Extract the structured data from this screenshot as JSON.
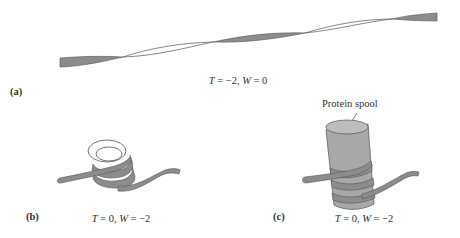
{
  "figure": {
    "colors": {
      "ribbon_fill": "#8c8c8c",
      "ribbon_stroke": "#555555",
      "spool_fill": "#a8a8a8",
      "spool_top": "#bdbdbd",
      "line": "#444444",
      "text": "#333333"
    },
    "panels": [
      {
        "id": "a",
        "label": "(a)",
        "caption": {
          "T_symbol": "T",
          "T_value": "−2",
          "W_symbol": "W",
          "W_value": "0",
          "text": "T = −2, W = 0"
        },
        "description": "Extended DNA ribbon with two negative twists (toroidal supercoil absent)"
      },
      {
        "id": "b",
        "label": "(b)",
        "caption": {
          "T_symbol": "T",
          "T_value": "0",
          "W_symbol": "W",
          "W_value": "−2",
          "text": "T = 0, W = −2"
        },
        "description": "Ribbon coiled into two writhe loops"
      },
      {
        "id": "c",
        "label": "(c)",
        "caption": {
          "T_symbol": "T",
          "T_value": "0",
          "W_symbol": "W",
          "W_value": "−2",
          "text": "T = 0, W = −2"
        },
        "callout": "Protein spool",
        "description": "Ribbon wrapped twice around a protein spool cylinder"
      }
    ]
  }
}
